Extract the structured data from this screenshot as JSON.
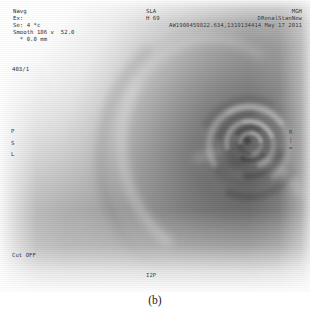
{
  "viewer": {
    "modality": "grayscale-ct-mr-scan",
    "caption": "(b)"
  },
  "overlay": {
    "study_info": "Navg\nEx:\nSe: 4 *c\nSmooth 186 v  52.0\n  * 0.0 mm",
    "series_id": "403/1",
    "orientation": "P\nS\nL",
    "cutoff_label": "Cut OFF",
    "inferior_marker": "I2P",
    "right_marker": "R\n|\n=",
    "patient_slice": "SLA\nH 69",
    "patient_id": "AW1900459822.634,1319134414",
    "institution": "MGH\nDRenalStanNew",
    "study_date": "May 17 2011"
  },
  "colors": {
    "overlay_text": "#2b2b2b",
    "caption_text": "#1a1a1a",
    "background": "#ffffff"
  }
}
